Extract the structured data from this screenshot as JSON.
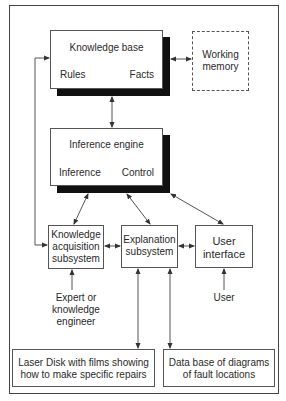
{
  "diagram": {
    "knowledge_base": {
      "title": "Knowledge base",
      "left_label": "Rules",
      "right_label": "Facts"
    },
    "working_memory": {
      "line1": "Working",
      "line2": "memory"
    },
    "inference_engine": {
      "title": "Inference engine",
      "left_label": "Inference",
      "right_label": "Control"
    },
    "knowledge_acquisition": {
      "line1": "Knowledge",
      "line2": "acquisition",
      "line3": "subsystem"
    },
    "explanation": {
      "line1": "Explanation",
      "line2": "subsystem"
    },
    "user_interface": {
      "line1": "User",
      "line2": "interface"
    },
    "expert": {
      "line1": "Expert or",
      "line2": "knowledge",
      "line3": "engineer"
    },
    "user": {
      "label": "User"
    },
    "laser_disk": {
      "line1": "Laser Disk with films showing",
      "line2": "how to make specific repairs"
    },
    "database": {
      "line1": "Data base of diagrams",
      "line2": "of fault locations"
    }
  },
  "colors": {
    "line": "#444444",
    "shadow": "#111111",
    "text": "#2a2a2a"
  }
}
